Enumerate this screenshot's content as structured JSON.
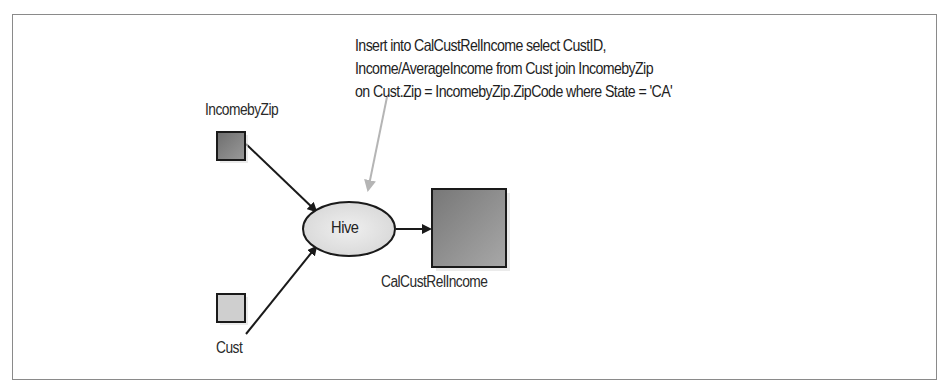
{
  "diagram": {
    "annotation": {
      "lines": [
        "Insert into CalCustRelIncome select CustID,",
        "Income/AverageIncome from Cust join IncomebyZip",
        "on Cust.Zip = IncomebyZip.ZipCode where State = 'CA'"
      ],
      "arrow_color": "#b0b0b0"
    },
    "nodes": {
      "incomebyzip": {
        "label": "IncomebyZip",
        "shape": "square",
        "fill": "#7a7a7a"
      },
      "cust": {
        "label": "Cust",
        "shape": "square",
        "fill": "#cfcfcf"
      },
      "hive": {
        "label": "Hive",
        "shape": "ellipse",
        "fill": "#e4e4e4"
      },
      "calcustrelincome": {
        "label": "CalCustRelIncome",
        "shape": "square",
        "fill": "#8a8a8a"
      }
    },
    "edges": [
      {
        "from": "IncomebyZip",
        "to": "Hive"
      },
      {
        "from": "Cust",
        "to": "Hive"
      },
      {
        "from": "Hive",
        "to": "CalCustRelIncome"
      }
    ],
    "colors": {
      "border": "#8a8a8a",
      "stroke": "#1a1a1a"
    }
  }
}
